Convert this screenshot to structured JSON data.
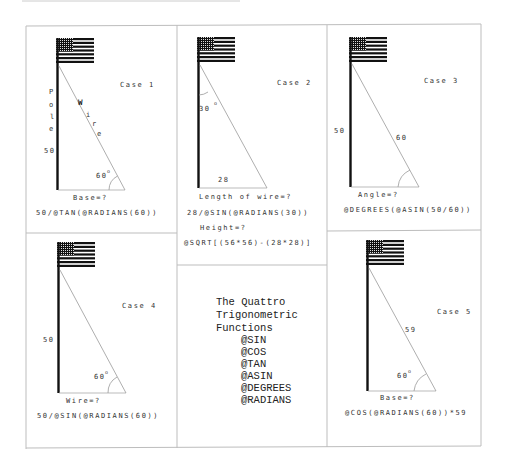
{
  "cases": [
    {
      "id": 1,
      "title": "Case 1",
      "pole_label_letters": [
        "P",
        "o",
        "l",
        "e"
      ],
      "pole_value": "50",
      "wire_label_letters": [
        "W",
        "i",
        "r",
        "e"
      ],
      "angle_label": "60",
      "unknown": "Base=?",
      "formula": "50/@TAN(@RADIANS(60))"
    },
    {
      "id": 2,
      "title": "Case 2",
      "angle_label": "30",
      "base_value": "28",
      "unknown": "Length of wire=?",
      "formula": "28/@SIN(@RADIANS(30))",
      "unknown2": "Height=?",
      "formula2": "@SQRT[(56*56)-(28*28)]"
    },
    {
      "id": 3,
      "title": "Case 3",
      "pole_value": "50",
      "wire_value": "60",
      "unknown": "Angle=?",
      "formula": "@DEGREES(@ASIN(50/60))"
    },
    {
      "id": 4,
      "title": "Case 4",
      "pole_value": "50",
      "angle_label": "60",
      "unknown": "Wire=?",
      "formula": "50/@SIN(@RADIANS(60))"
    },
    {
      "id": 5,
      "title": "Case 5",
      "wire_value": "59",
      "angle_label": "60",
      "unknown": "Base=?",
      "formula": "@COS(@RADIANS(60))*59"
    }
  ],
  "legend": {
    "title_lines": [
      "The Quattro",
      "Trigonometric",
      "Functions"
    ],
    "functions": [
      "@SIN",
      "@COS",
      "@TAN",
      "@ASIN",
      "@DEGREES",
      "@RADIANS"
    ]
  },
  "degree_symbol": "o"
}
